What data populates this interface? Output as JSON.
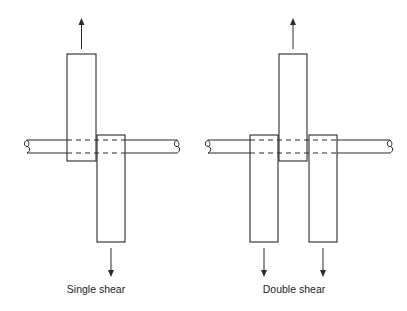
{
  "diagrams": [
    {
      "id": "single",
      "caption": "Single shear",
      "caption_x": 96,
      "rod": {
        "x1": 27,
        "x2": 177,
        "y_top": 140,
        "y_bottom": 153
      },
      "plates": [
        {
          "x": 67,
          "y": 54,
          "w": 29,
          "h": 107,
          "load": "up"
        },
        {
          "x": 97,
          "y": 135,
          "w": 28,
          "h": 107,
          "load": "down"
        }
      ]
    },
    {
      "id": "double",
      "caption": "Double shear",
      "caption_x": 294,
      "rod": {
        "x1": 208,
        "x2": 390,
        "y_top": 140,
        "y_bottom": 153
      },
      "plates": [
        {
          "x": 250,
          "y": 135,
          "w": 28,
          "h": 107,
          "load": "down"
        },
        {
          "x": 279,
          "y": 54,
          "w": 28,
          "h": 107,
          "load": "up"
        },
        {
          "x": 309,
          "y": 135,
          "w": 28,
          "h": 107,
          "load": "down"
        }
      ]
    }
  ],
  "colors": {
    "stroke": "#2a2a2a",
    "background": "#ffffff"
  }
}
